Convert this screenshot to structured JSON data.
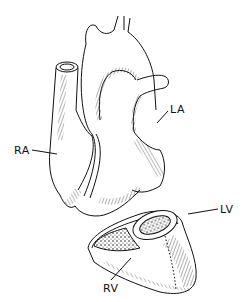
{
  "figure": {
    "labels": {
      "ra": "RA",
      "la": "LA",
      "lv": "LV",
      "rv": "RV"
    },
    "colors": {
      "ink": "#111111",
      "background": "#ffffff"
    }
  }
}
